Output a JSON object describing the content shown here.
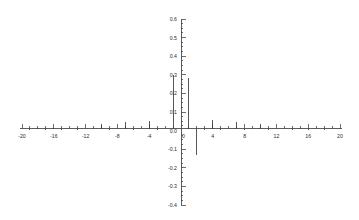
{
  "figure": {
    "background_color": "#ffffff",
    "line_color": "#3a3a3a",
    "axis_color": "#4a4a4a",
    "text_color": "#2b2b2b"
  },
  "chart_data": {
    "type": "bar",
    "subtype": "stem-impulse",
    "title": "",
    "subtitle": "",
    "xlabel": "",
    "ylabel": "",
    "xlim": [
      -20.5,
      20.5
    ],
    "ylim": [
      -0.4,
      0.6
    ],
    "grid": false,
    "legend": null,
    "legend_position": "none",
    "x_major_ticks": [
      -20,
      -16,
      -12,
      -8,
      -4,
      0,
      4,
      8,
      12,
      16,
      20
    ],
    "x_tick_labels": [
      "-20",
      "-16",
      "-12",
      "-8",
      "-4",
      "0",
      "4",
      "8",
      "12",
      "16",
      "20"
    ],
    "x_minor_tick_step": 1,
    "y_major_ticks": [
      -0.4,
      -0.3,
      -0.2,
      -0.1,
      0.0,
      0.1,
      0.2,
      0.3,
      0.4,
      0.5,
      0.6
    ],
    "y_tick_labels": [
      "-0.4",
      "-0.3",
      "-0.2",
      "-0.1",
      "0.0",
      "0.1",
      "0.2",
      "0.3",
      "0.4",
      "0.5",
      "0.6"
    ],
    "y_minor_tick_step": 0.025,
    "x": [
      -20,
      -19,
      -18,
      -17,
      -16,
      -15,
      -14,
      -13,
      -12,
      -11,
      -10,
      -9,
      -8,
      -7,
      -6,
      -5,
      -4,
      -3,
      -2,
      -1,
      0,
      1,
      2,
      3,
      4,
      5,
      6,
      7,
      8,
      9,
      10,
      11,
      12,
      13,
      14,
      15,
      16,
      17,
      18,
      19,
      20
    ],
    "values": [
      0.0,
      0.005,
      0.012,
      0.004,
      0.016,
      0.004,
      0.01,
      0.005,
      0.008,
      0.0,
      0.034,
      0.004,
      0.006,
      0.046,
      0.004,
      0.006,
      0.054,
      0.004,
      0.006,
      0.3,
      0.0,
      0.285,
      -0.13,
      0.004,
      0.055,
      0.004,
      0.006,
      0.046,
      0.004,
      0.006,
      0.035,
      0.004,
      0.006,
      0.01,
      0.004,
      0.012,
      0.004,
      0.01,
      0.005,
      0.006,
      0.0
    ]
  }
}
